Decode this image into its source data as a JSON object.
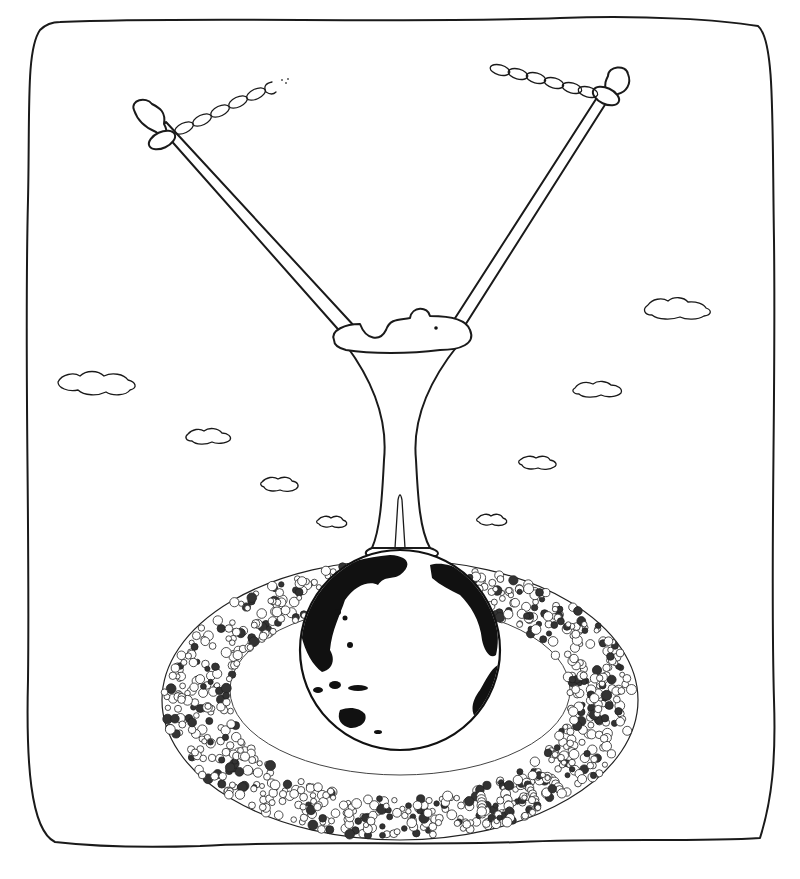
{
  "illustration": {
    "title": "",
    "description": "Pen-and-ink cartoon: a T-shaped stand with two arms chained at their ends, resting on a globe that is encircled by a dense crowd of people",
    "palette": {
      "ink": "#1a1a1a",
      "paper": "#ffffff",
      "land": "#111111"
    },
    "elements": {
      "frame": "hand-drawn wavy rounded border",
      "left_arm": {
        "name": "left-arm-with-chain",
        "chain_links": 6,
        "chain_end": "broken"
      },
      "right_arm": {
        "name": "right-arm-with-chain",
        "chain_links": 6,
        "chain_end": "broken"
      },
      "pedestal": "funnel-shaped stand with wavy top disc",
      "globe": {
        "name": "earth-globe",
        "visible_regions": [
          "Asia",
          "Australia",
          "Americas (edge)"
        ]
      },
      "crowd": "ring of tiny cartoon people around the globe",
      "clouds": 9
    }
  }
}
